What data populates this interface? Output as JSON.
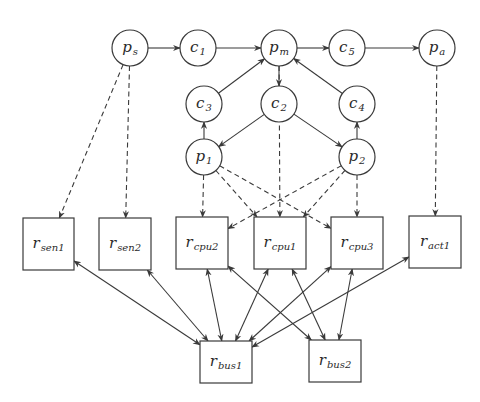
{
  "diagram": {
    "title": "",
    "style": {
      "stroke": "#3a3a3a",
      "background": "#ffffff",
      "node_radius": 18
    },
    "nodes": [
      {
        "id": "p_s",
        "shape": "circle",
        "base": "p",
        "sub": "s",
        "cx": 130,
        "cy": 48
      },
      {
        "id": "c1",
        "shape": "circle",
        "base": "c",
        "sub": "1",
        "cx": 198,
        "cy": 48
      },
      {
        "id": "p_m",
        "shape": "circle",
        "base": "p",
        "sub": "m",
        "cx": 279,
        "cy": 48
      },
      {
        "id": "c5",
        "shape": "circle",
        "base": "c",
        "sub": "5",
        "cx": 347,
        "cy": 48
      },
      {
        "id": "p_a",
        "shape": "circle",
        "base": "p",
        "sub": "a",
        "cx": 437,
        "cy": 48
      },
      {
        "id": "c3",
        "shape": "circle",
        "base": "c",
        "sub": "3",
        "cx": 204,
        "cy": 104
      },
      {
        "id": "c2",
        "shape": "circle",
        "base": "c",
        "sub": "2",
        "cx": 279,
        "cy": 104
      },
      {
        "id": "c4",
        "shape": "circle",
        "base": "c",
        "sub": "4",
        "cx": 357,
        "cy": 104
      },
      {
        "id": "p1",
        "shape": "circle",
        "base": "p",
        "sub": "1",
        "cx": 204,
        "cy": 157
      },
      {
        "id": "p2",
        "shape": "circle",
        "base": "p",
        "sub": "2",
        "cx": 357,
        "cy": 157
      },
      {
        "id": "r_sen1",
        "shape": "rect",
        "base": "r",
        "sub": "sen1",
        "x": 23,
        "y": 218,
        "w": 51,
        "h": 52
      },
      {
        "id": "r_sen2",
        "shape": "rect",
        "base": "r",
        "sub": "sen2",
        "x": 99,
        "y": 218,
        "w": 52,
        "h": 52
      },
      {
        "id": "r_cpu2",
        "shape": "rect",
        "base": "r",
        "sub": "cpu2",
        "x": 176,
        "y": 217,
        "w": 52,
        "h": 52
      },
      {
        "id": "r_cpu1",
        "shape": "rect",
        "base": "r",
        "sub": "cpu1",
        "x": 254,
        "y": 217,
        "w": 52,
        "h": 52
      },
      {
        "id": "r_cpu3",
        "shape": "rect",
        "base": "r",
        "sub": "cpu3",
        "x": 331,
        "y": 217,
        "w": 52,
        "h": 52
      },
      {
        "id": "r_act1",
        "shape": "rect",
        "base": "r",
        "sub": "act1",
        "x": 409,
        "y": 216,
        "w": 52,
        "h": 52
      },
      {
        "id": "r_bus1",
        "shape": "rect",
        "base": "r",
        "sub": "bus1",
        "x": 200,
        "y": 341,
        "w": 52,
        "h": 42
      },
      {
        "id": "r_bus2",
        "shape": "rect",
        "base": "r",
        "sub": "bus2",
        "x": 309,
        "y": 340,
        "w": 52,
        "h": 42
      }
    ],
    "edges": [
      {
        "from": "p_s",
        "to": "c1",
        "style": "solid",
        "dir": "forward"
      },
      {
        "from": "c1",
        "to": "p_m",
        "style": "solid",
        "dir": "forward"
      },
      {
        "from": "p_m",
        "to": "c5",
        "style": "solid",
        "dir": "forward"
      },
      {
        "from": "c5",
        "to": "p_a",
        "style": "solid",
        "dir": "forward"
      },
      {
        "from": "p_m",
        "to": "c2",
        "style": "solid",
        "dir": "forward"
      },
      {
        "from": "c3",
        "to": "p_m",
        "style": "solid",
        "dir": "forward"
      },
      {
        "from": "c4",
        "to": "p_m",
        "style": "solid",
        "dir": "forward"
      },
      {
        "from": "c2",
        "to": "p1",
        "style": "solid",
        "dir": "forward"
      },
      {
        "from": "c2",
        "to": "p2",
        "style": "solid",
        "dir": "forward"
      },
      {
        "from": "p1",
        "to": "c3",
        "style": "solid",
        "dir": "forward"
      },
      {
        "from": "p2",
        "to": "c4",
        "style": "solid",
        "dir": "forward"
      },
      {
        "from": "p_s",
        "to": "r_sen1",
        "style": "dashed",
        "dir": "forward"
      },
      {
        "from": "p_s",
        "to": "r_sen2",
        "style": "dashed",
        "dir": "forward"
      },
      {
        "from": "p_a",
        "to": "r_act1",
        "style": "dashed",
        "dir": "forward"
      },
      {
        "from": "p_m",
        "to": "r_cpu1",
        "style": "dashed",
        "dir": "forward"
      },
      {
        "from": "p1",
        "to": "r_cpu2",
        "style": "dashed",
        "dir": "forward"
      },
      {
        "from": "p1",
        "to": "r_cpu1",
        "style": "dashed",
        "dir": "forward"
      },
      {
        "from": "p1",
        "to": "r_cpu3",
        "style": "dashed",
        "dir": "forward"
      },
      {
        "from": "p2",
        "to": "r_cpu2",
        "style": "dashed",
        "dir": "forward"
      },
      {
        "from": "p2",
        "to": "r_cpu1",
        "style": "dashed",
        "dir": "forward"
      },
      {
        "from": "p2",
        "to": "r_cpu3",
        "style": "dashed",
        "dir": "forward"
      },
      {
        "from": "r_sen1",
        "to": "r_bus1",
        "style": "solid",
        "dir": "both"
      },
      {
        "from": "r_sen2",
        "to": "r_bus1",
        "style": "solid",
        "dir": "both"
      },
      {
        "from": "r_cpu2",
        "to": "r_bus1",
        "style": "solid",
        "dir": "both"
      },
      {
        "from": "r_cpu1",
        "to": "r_bus1",
        "style": "solid",
        "dir": "both"
      },
      {
        "from": "r_cpu3",
        "to": "r_bus1",
        "style": "solid",
        "dir": "both"
      },
      {
        "from": "r_act1",
        "to": "r_bus1",
        "style": "solid",
        "dir": "both"
      },
      {
        "from": "r_cpu2",
        "to": "r_bus2",
        "style": "solid",
        "dir": "both"
      },
      {
        "from": "r_cpu1",
        "to": "r_bus2",
        "style": "solid",
        "dir": "both"
      },
      {
        "from": "r_cpu3",
        "to": "r_bus2",
        "style": "solid",
        "dir": "both"
      }
    ]
  }
}
